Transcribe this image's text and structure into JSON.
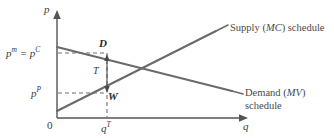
{
  "figure": {
    "background_color": "#ffffff",
    "line_color": "#555555",
    "dash_color": "#6f6f6f",
    "text_color": "#3a3a3a"
  },
  "axes": {
    "y_axis_label": "p",
    "x_axis_label": "q",
    "origin_label": "0",
    "y_tick_labels": [
      {
        "name": "consumer-price",
        "text": "p",
        "sup": "m",
        "text2": " = p",
        "sup2": "C",
        "value_y": 0.72
      },
      {
        "name": "producer-price",
        "text": "p",
        "sup": "P",
        "value_y": 0.36
      }
    ],
    "x_tick_labels": [
      {
        "name": "taxed-quantity",
        "text": "q",
        "sup": "T",
        "value_x": 0.33
      }
    ]
  },
  "curves": [
    {
      "name": "supply-curve",
      "label_line1": "Supply (",
      "label_italic": "MC",
      "label_line2": ") schedule",
      "full_label": "Supply (MC) schedule",
      "slope": "upward",
      "x0": 0.0,
      "y0": 0.07,
      "x1": 0.85,
      "y1": 0.8
    },
    {
      "name": "demand-curve",
      "label_line1": "Demand (",
      "label_italic": "MV",
      "label_line2": ")",
      "label_second_row": "schedule",
      "full_label": "Demand (MV) schedule",
      "slope": "downward",
      "x0": 0.0,
      "y0": 0.66,
      "x1": 0.94,
      "y1": 0.27
    }
  ],
  "points": [
    {
      "name": "point-d",
      "label": "D",
      "description": "consumer price point on demand curve"
    },
    {
      "name": "point-w",
      "label": "W",
      "description": "producer price point on supply curve"
    }
  ],
  "annotations": [
    {
      "name": "tax-wedge",
      "label": "T",
      "description": "vertical tax wedge between D and W"
    }
  ]
}
